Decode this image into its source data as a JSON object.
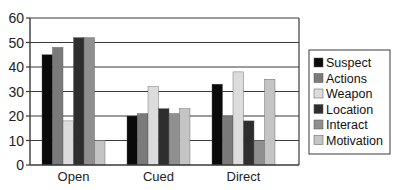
{
  "chart_data": {
    "type": "bar",
    "title": "",
    "xlabel": "",
    "ylabel": "",
    "ylim": [
      0,
      60
    ],
    "yticks": [
      0,
      10,
      20,
      30,
      40,
      50,
      60
    ],
    "grid": true,
    "legend_position": "right",
    "categories": [
      "Open",
      "Cued",
      "Direct"
    ],
    "series": [
      {
        "name": "Suspect",
        "color": "#0a0a0a",
        "values": [
          45,
          20,
          33
        ]
      },
      {
        "name": "Actions",
        "color": "#7a7a7a",
        "values": [
          48,
          21,
          20
        ]
      },
      {
        "name": "Weapon",
        "color": "#dcdcdc",
        "values": [
          18,
          32,
          38
        ]
      },
      {
        "name": "Location",
        "color": "#2e2e2e",
        "values": [
          52,
          23,
          18
        ]
      },
      {
        "name": "Interact",
        "color": "#8f8f8f",
        "values": [
          52,
          21,
          10
        ]
      },
      {
        "name": "Motivation",
        "color": "#c4c4c4",
        "values": [
          10,
          23,
          35
        ]
      }
    ]
  }
}
